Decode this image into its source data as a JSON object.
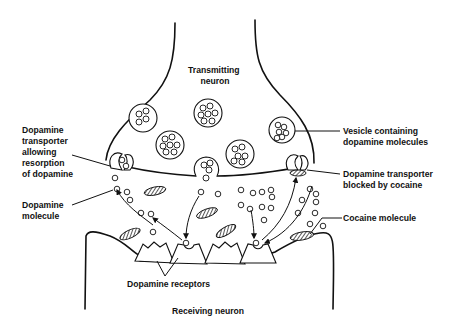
{
  "diagram": {
    "labels": {
      "transmitting_neuron": [
        "Transmitting",
        "neuron"
      ],
      "vesicle": [
        "Vesicle containing",
        "dopamine molecules"
      ],
      "transporter_allowing": [
        "Dopamine",
        "transporter",
        "allowing",
        "resorption",
        "of dopamine"
      ],
      "transporter_blocked": [
        "Dopamine transporter",
        "blocked by cocaine"
      ],
      "dopamine_molecule": [
        "Dopamine",
        "molecule"
      ],
      "cocaine_molecule": "Cocaine molecule",
      "dopamine_receptors": "Dopamine receptors",
      "receiving_neuron": "Receiving neuron"
    },
    "colors": {
      "line": "#111111",
      "background": "#ffffff"
    }
  }
}
